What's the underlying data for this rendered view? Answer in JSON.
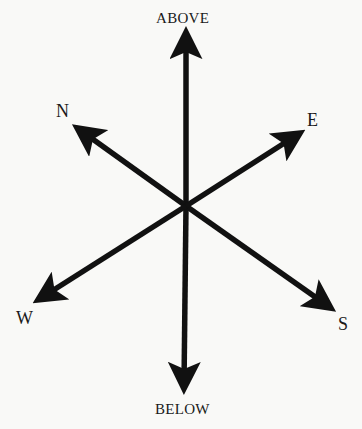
{
  "diagram": {
    "colors": {
      "background": "#f9f9f7",
      "ink": "#111111"
    },
    "center": {
      "x": 186,
      "y": 206
    },
    "labels": {
      "above": "ABOVE",
      "below": "BELOW",
      "north": "N",
      "east": "E",
      "west": "W",
      "south": "S"
    },
    "arrows": [
      {
        "id": "above",
        "tip": [
          186,
          26
        ]
      },
      {
        "id": "below",
        "tip": [
          184,
          395
        ]
      },
      {
        "id": "north",
        "tip": [
          72,
          124
        ]
      },
      {
        "id": "south",
        "tip": [
          336,
          312
        ]
      },
      {
        "id": "east",
        "tip": [
          305,
          130
        ]
      },
      {
        "id": "west",
        "tip": [
          33,
          303
        ]
      }
    ]
  }
}
